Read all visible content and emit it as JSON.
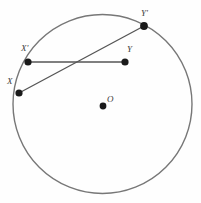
{
  "figure": {
    "type": "geometry-diagram",
    "background_color": "#fefefe",
    "width": 201,
    "height": 203
  },
  "circle": {
    "name": "main-circle",
    "center_x": 102.5,
    "center_y": 104,
    "radius": 89.5,
    "stroke_color": "#777777",
    "stroke_width": 1.4,
    "fill": "none"
  },
  "center_point": {
    "label": "O",
    "x": 103,
    "y": 106,
    "label_x": 107,
    "label_y": 95,
    "radius": 3.4,
    "color": "#1a1a1a"
  },
  "points": [
    {
      "id": "X",
      "label": "X",
      "x": 19,
      "y": 93,
      "label_x": 7,
      "label_y": 77,
      "radius": 3.6,
      "color": "#1a1a1a"
    },
    {
      "id": "Xprime",
      "label": "X'",
      "x": 28,
      "y": 62,
      "label_x": 21,
      "label_y": 44,
      "radius": 3.6,
      "color": "#1a1a1a"
    },
    {
      "id": "Y",
      "label": "Y",
      "x": 125,
      "y": 62,
      "label_x": 127,
      "label_y": 45,
      "radius": 3.6,
      "color": "#1a1a1a"
    },
    {
      "id": "Yprime",
      "label": "Y'",
      "x": 144,
      "y": 26,
      "label_x": 141,
      "label_y": 9,
      "radius": 3.9,
      "color": "#1a1a1a"
    }
  ],
  "segments": [
    {
      "id": "segment-X-Yprime",
      "from": "X",
      "to": "Yprime",
      "x1": 19,
      "y1": 93,
      "x2": 144,
      "y2": 26,
      "stroke_color": "#555555",
      "stroke_width": 1.3
    },
    {
      "id": "segment-Xprime-Y",
      "from": "Xprime",
      "to": "Y",
      "x1": 28,
      "y1": 62,
      "x2": 125,
      "y2": 62,
      "stroke_color": "#555555",
      "stroke_width": 1.3
    }
  ],
  "colors": {
    "stroke": "#777777",
    "segment": "#555555",
    "point": "#1a1a1a",
    "label": "#3a3a3a",
    "background": "#fefefe"
  }
}
